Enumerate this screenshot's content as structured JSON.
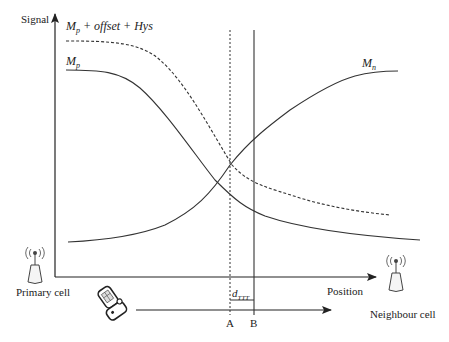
{
  "axes": {
    "y_label": "Signal",
    "x_label": "Position"
  },
  "curves": {
    "threshold_label": "M_p + offset + Hys",
    "threshold_label_parts": {
      "base": "M",
      "sub": "p",
      "rest": " + offset + Hys"
    },
    "primary_label": {
      "base": "M",
      "sub": "p"
    },
    "neighbour_label": {
      "base": "M",
      "sub": "n"
    }
  },
  "markers": {
    "a_label": "A",
    "b_label": "B",
    "interval_label": {
      "base": "d",
      "sub": "TTT"
    }
  },
  "cells": {
    "primary": "Primary cell",
    "neighbour": "Neighbour cell"
  },
  "icons": {
    "primary_tower": "antenna-tower-icon",
    "neighbour_tower": "antenna-tower-icon",
    "mobile": "mobile-phone-icon"
  },
  "colors": {
    "line": "#333333",
    "background": "#ffffff"
  }
}
